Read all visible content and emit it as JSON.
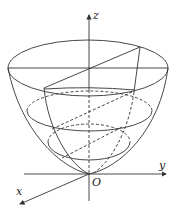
{
  "diagram": {
    "title": "",
    "type": "paraboloid with coordinate axes",
    "stroke_color": "#333333",
    "axes": {
      "x_label": "x",
      "y_label": "y",
      "z_label": "z",
      "origin_label": "O"
    },
    "elements": [
      "paraboloid silhouette",
      "top ellipse (cross-section)",
      "middle ellipse (dashed back, solid front)",
      "lower ellipse (dashed back, solid front)",
      "diagonal plane slice (parabolic section)"
    ]
  }
}
